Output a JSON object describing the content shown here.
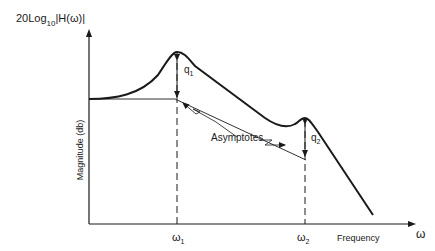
{
  "diagram": {
    "y_axis_label": "20 Log10 |H(ω)|",
    "y_axis_label_parts": {
      "prefix": "20Log",
      "subscript": "10",
      "suffix": "|H(ω)|"
    },
    "y_axis_title": "Magnitude (db)",
    "x_axis_symbol": "ω",
    "x_axis_title": "Frequency",
    "ticks": [
      {
        "symbol": "ω",
        "subscript": "1"
      },
      {
        "symbol": "ω",
        "subscript": "2"
      }
    ],
    "annotations": {
      "peak1": {
        "symbol": "q",
        "subscript": "1"
      },
      "peak2": {
        "symbol": "q",
        "subscript": "2"
      },
      "asymptotes": "Asymptotes"
    },
    "colors": {
      "ink": "#1a1a1a",
      "background": "#ffffff"
    }
  }
}
